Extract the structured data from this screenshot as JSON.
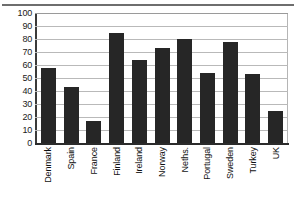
{
  "chart_data": {
    "type": "bar",
    "title": "",
    "xlabel": "",
    "ylabel": "",
    "categories": [
      "Denmark",
      "Spain",
      "France",
      "Finland",
      "Ireland",
      "Norway",
      "Neths.",
      "Portugal",
      "Sweden",
      "Turkey",
      "UK"
    ],
    "values": [
      58,
      43,
      17,
      85,
      64,
      73,
      80,
      54,
      78,
      53,
      25
    ],
    "ylim": [
      0,
      100
    ],
    "ytick_labels": [
      "100",
      "90",
      "80",
      "70",
      "60",
      "50",
      "40",
      "30",
      "20",
      "10",
      "0"
    ],
    "ytick_values": [
      100,
      90,
      80,
      70,
      60,
      50,
      40,
      30,
      20,
      10,
      0
    ],
    "grid": true,
    "legend": null,
    "bar_color": "#262626",
    "grid_color": "#b9b9b9",
    "axis_color": "#2b2b2b"
  }
}
